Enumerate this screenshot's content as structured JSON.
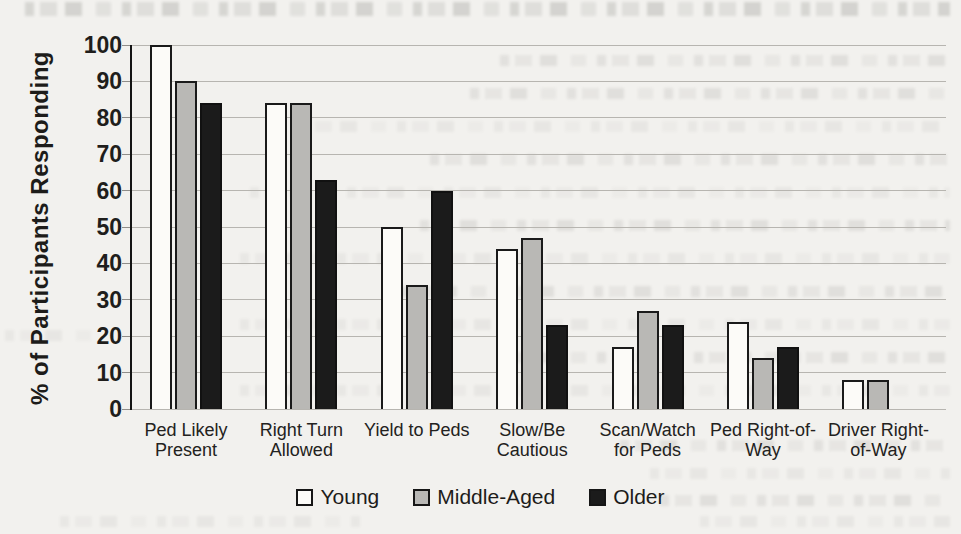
{
  "figure": {
    "background_color": "#f2f1ee",
    "text_color": "#1d1c1a",
    "gridline_color": "#b7b5b0"
  },
  "chart_data": {
    "type": "bar",
    "title": "",
    "y_axis_title": "% of Participants Responding",
    "categories": [
      "Ped Likely Present",
      "Right Turn Allowed",
      "Yield to Peds",
      "Slow/Be Cautious",
      "Scan/Watch for Peds",
      "Ped Right-of-Way",
      "Driver Right-of-Way"
    ],
    "category_label_lines": [
      [
        "Ped Likely",
        "Present"
      ],
      [
        "Right Turn",
        "Allowed"
      ],
      [
        "Yield to Peds"
      ],
      [
        "Slow/Be",
        "Cautious"
      ],
      [
        "Scan/Watch",
        "for Peds"
      ],
      [
        "Ped Right-of-",
        "Way"
      ],
      [
        "Driver Right-",
        "of-Way"
      ]
    ],
    "series": [
      {
        "name": "Young",
        "fill": "#fcfbf8",
        "border": "#1a1a1a",
        "values": [
          100,
          84,
          50,
          44,
          17,
          24,
          8
        ]
      },
      {
        "name": "Middle-Aged",
        "fill": "#b9b8b5",
        "border": "#1a1a1a",
        "values": [
          90,
          84,
          34,
          47,
          27,
          14,
          8
        ]
      },
      {
        "name": "Older",
        "fill": "#1b1b1b",
        "border": "#111111",
        "values": [
          84,
          63,
          60,
          23,
          23,
          17,
          0
        ]
      }
    ],
    "ylim": [
      0,
      100
    ],
    "tick_step": 10,
    "grid": true,
    "legend_position": "bottom"
  }
}
